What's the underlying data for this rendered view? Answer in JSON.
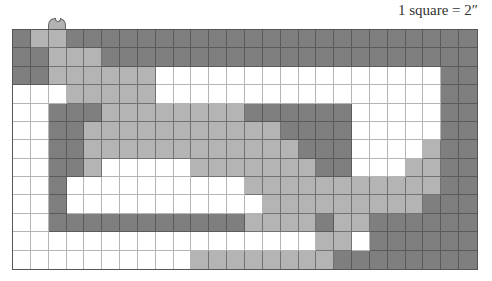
{
  "scale_label": "1 square = 2″",
  "colors": {
    "D": "#7f7f7f",
    "L": "#b4b4b4",
    "W": "#ffffff",
    "grid_line": "#555555"
  },
  "grid": {
    "columns": 26,
    "rows": 13,
    "legend": {
      "D": "dark gray",
      "L": "light gray",
      "W": "white"
    },
    "cells": [
      "DLLDDDDDDDDDDDDDDDDDDDDDDD",
      "DDLLLDDDDDDDDDDDDDDDDDDDDD",
      "DDLLLLLLWWWWWWWWWWWWWWWWDD",
      "WWWLLLLLWWWWWWWWWWWWWWWWDD",
      "WWDDDLLLLLLLLDDDDDDWWWWWDD",
      "WWDDLLLLLLLLLLLDDDDWWWWWDD",
      "WWDDLLLLLLLLLLLLDDDWWWWLDD",
      "WWDDLWWWWWLLLLLLLDDWWWLLDD",
      "WWDWWWWWWWWWWLLLLLLLLLLLDD",
      "WWDWWWWWWWWWWWLLLLLLLLLDDD",
      "WWDDDDDDDDDDDLLLLDLLDDDDDD",
      "WWWWWWWWWWWWWWWWWLLWDDDDDD",
      "WWWWWWWWWWLLLLLLLLDDDDDDDD"
    ]
  },
  "tab": {
    "column": 2,
    "shade": "L"
  }
}
